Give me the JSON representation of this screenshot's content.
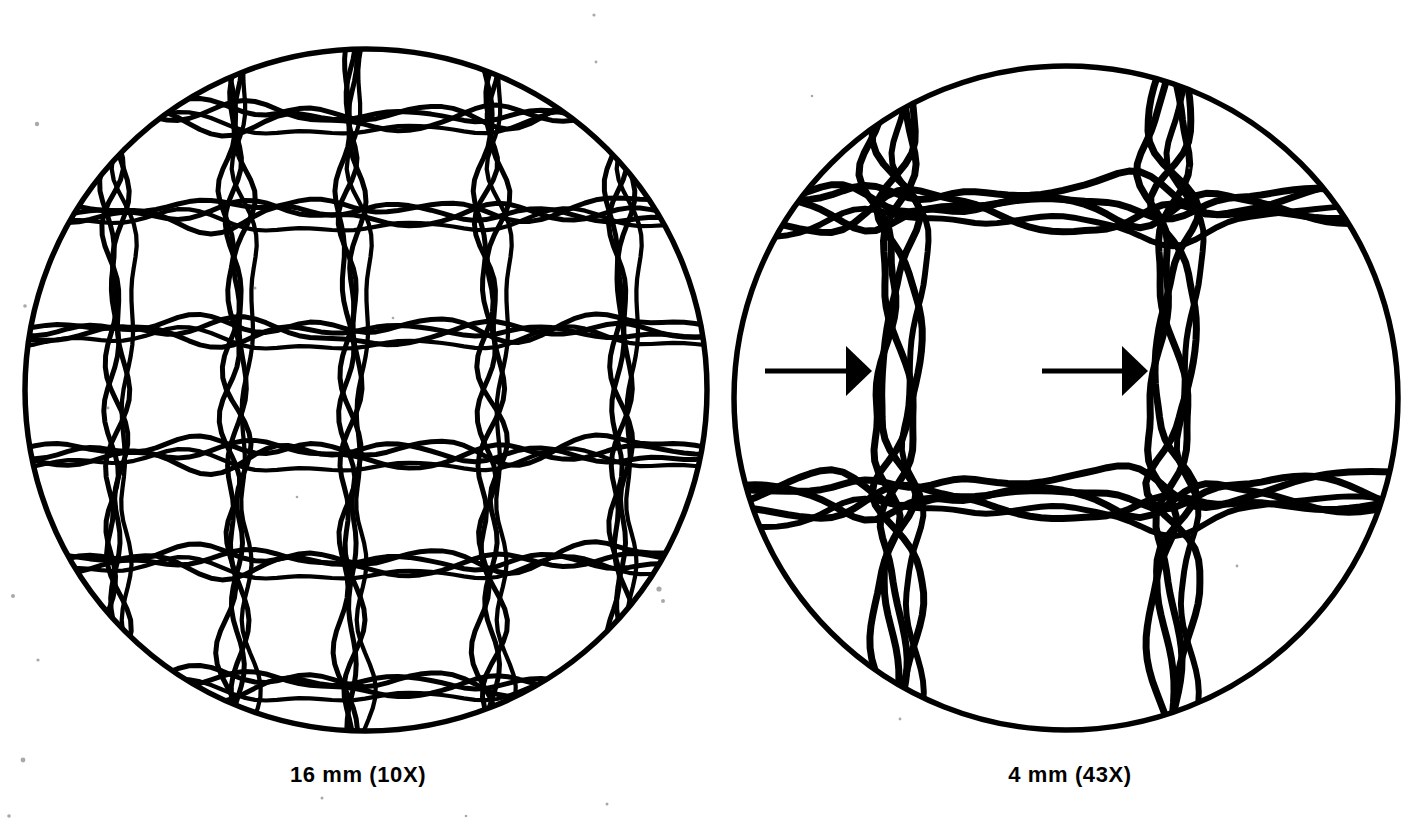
{
  "figure": {
    "background_color": "#ffffff",
    "ink_color": "#000000",
    "panels": [
      {
        "id": "left-panel",
        "caption": "16 mm (10X)",
        "objective_mm": "16 mm",
        "magnification": "10X",
        "field_center": {
          "x": 366,
          "y": 390
        },
        "field_radius": 345,
        "warp_yarn_count": 5,
        "weft_yarn_count": 6,
        "warp_x": [
          115,
          235,
          350,
          490,
          620
        ],
        "weft_y": [
          115,
          212,
          330,
          452,
          560,
          682
        ],
        "strands_per_yarn": 3,
        "annotations": []
      },
      {
        "id": "right-panel",
        "caption": "4 mm (43X)",
        "objective_mm": "4 mm",
        "magnification": "43X",
        "field_center": {
          "x": 1066,
          "y": 398
        },
        "field_radius": 336,
        "warp_yarn_count": 2,
        "weft_yarn_count": 2,
        "warp_x": [
          895,
          1170
        ],
        "weft_y": [
          205,
          495
        ],
        "strands_per_yarn": 4,
        "annotations": [
          {
            "type": "arrow",
            "direction": "right",
            "tail_x": 765,
            "head_x": 872,
            "y": 371,
            "points_at": "warp-yarn-1"
          },
          {
            "type": "arrow",
            "direction": "right",
            "tail_x": 1042,
            "head_x": 1148,
            "y": 371,
            "points_at": "warp-yarn-2"
          }
        ]
      }
    ],
    "specks": [
      {
        "x": 37,
        "y": 124,
        "r": 2.2
      },
      {
        "x": 25,
        "y": 306,
        "r": 1.8
      },
      {
        "x": 13,
        "y": 596,
        "r": 2.0
      },
      {
        "x": 38,
        "y": 660,
        "r": 1.6
      },
      {
        "x": 23,
        "y": 760,
        "r": 2.4
      },
      {
        "x": 9,
        "y": 816,
        "r": 1.8
      },
      {
        "x": 255,
        "y": 288,
        "r": 1.5
      },
      {
        "x": 108,
        "y": 408,
        "r": 1.4
      },
      {
        "x": 297,
        "y": 497,
        "r": 1.3
      },
      {
        "x": 393,
        "y": 318,
        "r": 1.3
      },
      {
        "x": 596,
        "y": 62,
        "r": 1.4
      },
      {
        "x": 594,
        "y": 15,
        "r": 1.6
      },
      {
        "x": 322,
        "y": 798,
        "r": 1.5
      },
      {
        "x": 466,
        "y": 816,
        "r": 1.3
      },
      {
        "x": 607,
        "y": 804,
        "r": 1.5
      },
      {
        "x": 900,
        "y": 719,
        "r": 1.4
      },
      {
        "x": 1237,
        "y": 566,
        "r": 1.4
      },
      {
        "x": 1189,
        "y": 168,
        "r": 1.3
      },
      {
        "x": 812,
        "y": 96,
        "r": 1.3
      },
      {
        "x": 659,
        "y": 589,
        "r": 2.6
      },
      {
        "x": 663,
        "y": 601,
        "r": 2.0
      }
    ]
  }
}
